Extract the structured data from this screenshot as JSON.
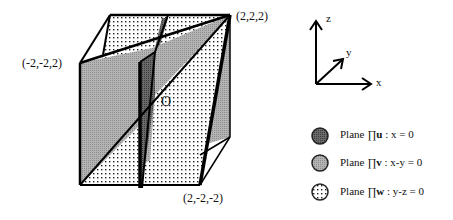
{
  "diagram": {
    "vertex_labels": {
      "top_right": "(2,2,2)",
      "top_left": "(-2,-2,2)",
      "bottom_right": "(2,-2,-2)",
      "origin": "O"
    },
    "axes": {
      "x": "x",
      "y": "y",
      "z": "z"
    }
  },
  "legend": [
    {
      "prefix": "Plane ∏",
      "bold": "u",
      "suffix": " :  x = 0",
      "fill": "dark-gray",
      "color": "#555555"
    },
    {
      "prefix": "Plane ∏",
      "bold": "v",
      "suffix": " :  x-y = 0",
      "fill": "light-gray",
      "color": "#a8a8a8"
    },
    {
      "prefix": "Plane ∏",
      "bold": "w",
      "suffix": " :  y-z = 0",
      "fill": "dotted",
      "color": "#ffffff"
    }
  ],
  "colors": {
    "plane_u": "#555555",
    "plane_v": "#a8a8a8",
    "plane_w_dots": "#222222",
    "edge": "#000000"
  }
}
